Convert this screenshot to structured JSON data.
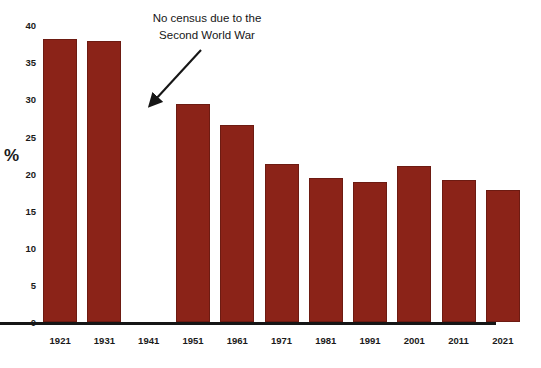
{
  "chart_data": {
    "type": "bar",
    "title": "",
    "xlabel": "",
    "ylabel": "%",
    "ylim": [
      0,
      40
    ],
    "yticks": [
      0,
      5,
      10,
      15,
      20,
      25,
      30,
      35,
      40
    ],
    "grid": false,
    "legend": null,
    "bar_color": "#8b2318",
    "categories": [
      "1921",
      "1931",
      "1941",
      "1951",
      "1961",
      "1971",
      "1981",
      "1991",
      "2001",
      "2011",
      "2021"
    ],
    "values": [
      37.0,
      36.7,
      null,
      28.5,
      25.7,
      20.7,
      18.8,
      18.3,
      20.4,
      18.6,
      17.3
    ],
    "annotations": [
      {
        "text": "No census due to the Second World War",
        "line1": "No census due to the",
        "line2": "Second World War",
        "points_to_category": "1941",
        "arrow": "down-left-arrow"
      }
    ]
  },
  "axis": {
    "ylabel": "%",
    "ytick_labels": [
      "40",
      "35",
      "30",
      "25",
      "20",
      "15",
      "10",
      "5",
      "0"
    ],
    "xtick_labels": [
      "1921",
      "1931",
      "1941",
      "1951",
      "1961",
      "1971",
      "1981",
      "1991",
      "2001",
      "2011",
      "2021"
    ]
  },
  "annotation": {
    "line1": "No census due to the",
    "line2": "Second World War"
  }
}
